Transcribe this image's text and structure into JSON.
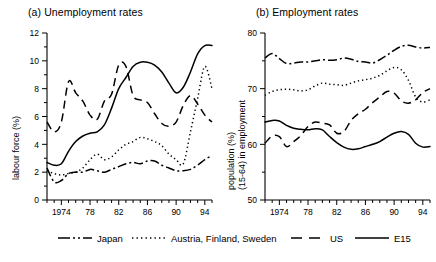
{
  "figure": {
    "background": "#ffffff",
    "foreground": "#000000"
  },
  "panel_a": {
    "title": "(a) Unemployment rates",
    "ylabel": "labour force (%)"
  },
  "panel_b": {
    "title": "(b) Employment rates",
    "ylabel_line1": "population (%)",
    "ylabel_line2": "(15-64) in employment"
  },
  "legend": {
    "items": [
      {
        "label": "Japan",
        "style": "dash-dot"
      },
      {
        "label": "Austria, Finland, Sweden",
        "style": "dotted"
      },
      {
        "label": "US",
        "style": "dashed"
      },
      {
        "label": "E15",
        "style": "solid"
      }
    ]
  },
  "chart_data": [
    {
      "id": "panel-a",
      "type": "line",
      "title": "(a) Unemployment rates",
      "xlabel": "",
      "ylabel": "labour force (%)",
      "xlim": [
        1972,
        1995
      ],
      "ylim": [
        0,
        12
      ],
      "yticks": [
        0,
        2,
        4,
        6,
        8,
        10,
        12
      ],
      "yticklabels": [
        "0",
        "2",
        "4",
        "6",
        "8",
        "10",
        "12"
      ],
      "yminor_step": 1,
      "xticks": [
        1974,
        1978,
        1982,
        1986,
        1990,
        1994
      ],
      "xticklabels": [
        "1974",
        "78",
        "82",
        "86",
        "90",
        "94"
      ],
      "xminor_step": 1,
      "grid": false,
      "legend_position": "below-figure",
      "x": [
        1972,
        1973,
        1974,
        1975,
        1976,
        1977,
        1978,
        1979,
        1980,
        1981,
        1982,
        1983,
        1984,
        1985,
        1986,
        1987,
        1988,
        1989,
        1990,
        1991,
        1992,
        1993,
        1994,
        1995
      ],
      "series": [
        {
          "name": "E15",
          "style": "solid",
          "values": [
            2.7,
            2.5,
            2.6,
            3.5,
            4.2,
            4.6,
            4.8,
            4.9,
            5.4,
            6.6,
            8.0,
            8.8,
            9.6,
            9.9,
            9.9,
            9.7,
            9.2,
            8.4,
            7.7,
            8.1,
            9.2,
            10.5,
            11.1,
            11.1
          ]
        },
        {
          "name": "US",
          "style": "dashed",
          "values": [
            5.6,
            4.9,
            5.6,
            8.5,
            7.7,
            7.1,
            6.1,
            5.8,
            7.1,
            7.6,
            9.7,
            9.6,
            7.5,
            7.2,
            7.0,
            6.2,
            5.5,
            5.3,
            5.6,
            6.8,
            7.5,
            6.9,
            6.1,
            5.6
          ]
        },
        {
          "name": "Austria, Finland, Sweden",
          "style": "dotted",
          "values": [
            2.1,
            1.9,
            1.8,
            1.9,
            2.0,
            2.3,
            2.9,
            3.3,
            2.9,
            3.1,
            3.6,
            4.0,
            4.2,
            4.5,
            4.4,
            4.2,
            3.9,
            3.3,
            2.9,
            2.6,
            4.9,
            7.3,
            9.6,
            8.0
          ]
        },
        {
          "name": "Japan",
          "style": "dash-dot",
          "values": [
            2.3,
            1.3,
            1.4,
            1.9,
            2.0,
            2.0,
            2.2,
            2.1,
            2.0,
            2.2,
            2.4,
            2.6,
            2.7,
            2.6,
            2.8,
            2.8,
            2.5,
            2.3,
            2.1,
            2.1,
            2.2,
            2.5,
            2.9,
            3.2
          ]
        }
      ]
    },
    {
      "id": "panel-b",
      "type": "line",
      "title": "(b) Employment rates",
      "xlabel": "",
      "ylabel": "population (%) (15-64) in employment",
      "xlim": [
        1972,
        1995
      ],
      "ylim": [
        50,
        80
      ],
      "yticks": [
        50,
        60,
        70,
        80
      ],
      "yticklabels": [
        "50",
        "60",
        "70",
        "80"
      ],
      "yminor_step": 5,
      "xticks": [
        1974,
        1978,
        1982,
        1986,
        1990,
        1994
      ],
      "xticklabels": [
        "1974",
        "78",
        "82",
        "86",
        "90",
        "94"
      ],
      "xminor_step": 1,
      "grid": false,
      "legend_position": "below-figure",
      "x": [
        1972,
        1973,
        1974,
        1975,
        1976,
        1977,
        1978,
        1979,
        1980,
        1981,
        1982,
        1983,
        1984,
        1985,
        1986,
        1987,
        1988,
        1989,
        1990,
        1991,
        1992,
        1993,
        1994,
        1995
      ],
      "series": [
        {
          "name": "Japan",
          "style": "dash-dot",
          "values": [
            75.5,
            76.3,
            75.4,
            74.5,
            74.6,
            74.8,
            74.8,
            75.0,
            75.2,
            75.1,
            75.2,
            75.5,
            75.3,
            74.9,
            74.8,
            74.6,
            75.2,
            76.0,
            76.9,
            77.6,
            77.8,
            77.5,
            77.3,
            77.4
          ]
        },
        {
          "name": "Austria, Finland, Sweden",
          "style": "dotted",
          "values": [
            68.8,
            69.5,
            69.8,
            69.9,
            69.8,
            69.6,
            69.8,
            70.5,
            71.0,
            70.8,
            70.7,
            70.6,
            71.0,
            71.4,
            71.6,
            71.9,
            72.4,
            73.2,
            73.8,
            73.4,
            71.5,
            68.5,
            67.6,
            68.0
          ]
        },
        {
          "name": "US",
          "style": "dashed",
          "values": [
            60.2,
            61.5,
            61.4,
            59.6,
            60.5,
            61.6,
            63.2,
            64.0,
            63.8,
            63.5,
            62.0,
            62.3,
            64.3,
            65.5,
            66.3,
            67.5,
            68.5,
            69.5,
            69.2,
            67.8,
            67.4,
            68.0,
            69.3,
            70.0
          ]
        },
        {
          "name": "E15",
          "style": "solid",
          "values": [
            64.0,
            64.3,
            64.2,
            63.4,
            62.9,
            62.7,
            62.6,
            62.8,
            62.6,
            61.4,
            60.3,
            59.5,
            59.1,
            59.2,
            59.6,
            60.0,
            60.5,
            61.3,
            62.0,
            62.3,
            61.8,
            60.2,
            59.5,
            59.6
          ]
        }
      ]
    }
  ]
}
